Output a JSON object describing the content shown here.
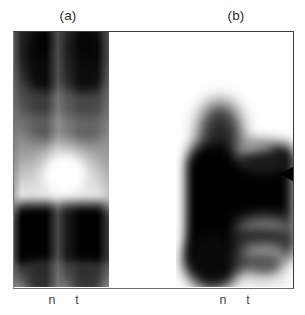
{
  "figure": {
    "kind": "autoradiograph-gel-figure",
    "panels": [
      {
        "letter": "(a)",
        "lanes": [
          {
            "label": "n",
            "meaning": "normal"
          },
          {
            "label": "t",
            "meaning": "tumour"
          }
        ]
      },
      {
        "letter": "(b)",
        "lanes": [
          {
            "label": "n",
            "meaning": "normal"
          },
          {
            "label": "t",
            "meaning": "tumour"
          }
        ]
      }
    ],
    "markers": [
      {
        "name": "arrowhead",
        "glyph": "◀",
        "points": "left",
        "panel": "(b)"
      }
    ],
    "colors": {
      "background": "#ffffff",
      "frame": "#3a3a3a",
      "band_dark": "#000000",
      "band_mid": "#5a5a5a",
      "band_light": "#ffffff",
      "label_text": "#2b2b2b",
      "lane_text": "#4a4a4a",
      "marker": "#000000"
    }
  }
}
